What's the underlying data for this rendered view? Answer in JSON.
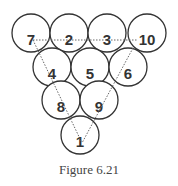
{
  "figure": {
    "caption": "Figure 6.21",
    "pin_radius": 19,
    "pins": [
      {
        "label": "7",
        "cx": 31,
        "cy": 33
      },
      {
        "label": "2",
        "cx": 69,
        "cy": 33
      },
      {
        "label": "3",
        "cx": 107,
        "cy": 33
      },
      {
        "label": "10",
        "cx": 147,
        "cy": 33
      },
      {
        "label": "4",
        "cx": 52,
        "cy": 67
      },
      {
        "label": "5",
        "cx": 90,
        "cy": 67
      },
      {
        "label": "6",
        "cx": 128,
        "cy": 67
      },
      {
        "label": "8",
        "cx": 61,
        "cy": 100
      },
      {
        "label": "9",
        "cx": 99,
        "cy": 100
      },
      {
        "label": "1",
        "cx": 80,
        "cy": 135
      }
    ],
    "guide_lines": [
      {
        "from": "7",
        "to": "10",
        "x1": 33,
        "y1": 40,
        "x2": 137,
        "y2": 40
      },
      {
        "from": "7",
        "to": "1",
        "x1": 33,
        "y1": 40,
        "x2": 82,
        "y2": 143
      },
      {
        "from": "10",
        "to": "1",
        "x1": 133,
        "y1": 48,
        "x2": 82,
        "y2": 143
      }
    ],
    "colors": {
      "stroke": "#333333",
      "guide": "#666666",
      "caption": "#444444"
    }
  }
}
